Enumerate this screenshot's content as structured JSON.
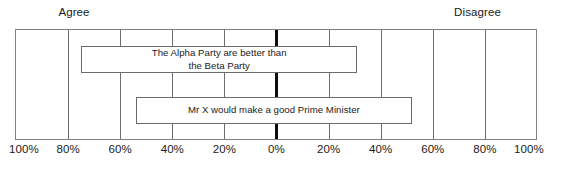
{
  "chart_data": {
    "type": "bar",
    "orientation": "horizontal",
    "subtype": "diverging",
    "title": "",
    "xlabel": "",
    "ylabel": "",
    "xlim": [
      -100,
      100
    ],
    "grid": true,
    "legend_position": "none",
    "side_headers": {
      "left": "Agree",
      "right": "Disagree"
    },
    "xticks": [
      {
        "label": "100%",
        "value": -100
      },
      {
        "label": "80%",
        "value": -80
      },
      {
        "label": "60%",
        "value": -60
      },
      {
        "label": "40%",
        "value": -40
      },
      {
        "label": "20%",
        "value": -20
      },
      {
        "label": "0%",
        "value": 0
      },
      {
        "label": "20%",
        "value": 20
      },
      {
        "label": "40%",
        "value": 40
      },
      {
        "label": "60%",
        "value": 60
      },
      {
        "label": "80%",
        "value": 80
      },
      {
        "label": "100%",
        "value": 100
      }
    ],
    "categories": [
      "The Alpha Party are better than the Beta Party",
      "Mr X would make a good Prime Minister"
    ],
    "series": [
      {
        "name": "Agree",
        "values": [
          75,
          54
        ]
      },
      {
        "name": "Disagree",
        "values": [
          31,
          52
        ]
      }
    ],
    "bars": [
      {
        "label": "The Alpha Party are better than\nthe Beta Party",
        "agree": 75,
        "disagree": 31,
        "start": -75,
        "end": 31
      },
      {
        "label": "Mr X would make a good Prime Minister",
        "agree": 54,
        "disagree": 52,
        "start": -54,
        "end": 52
      }
    ],
    "colors": {
      "bar_fill": "#ffffff",
      "bar_stroke": "#6a6a6a",
      "gridline": "#6e6e6e",
      "zero_line": "#0d0d0d",
      "frame": "#808080",
      "text": "#1a1a1a",
      "background": "#ffffff"
    }
  }
}
